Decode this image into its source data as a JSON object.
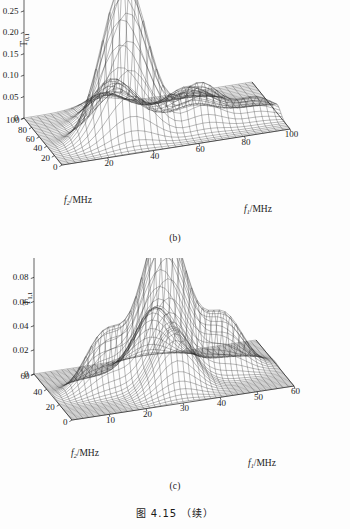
{
  "figure": {
    "caption": "图 4.15 （续）",
    "panels": [
      {
        "id": "b",
        "sublabel": "(b)"
      },
      {
        "id": "c",
        "sublabel": "(c)"
      }
    ]
  },
  "chart_data": [
    {
      "type": "surface",
      "panel": "(b)",
      "title": "",
      "zlabel_base": "T",
      "zlabel_sub": "0,1",
      "xlabel_base": "f",
      "xlabel_sub": "1",
      "xlabel_unit": "/MHz",
      "ylabel_base": "f",
      "ylabel_sub": "2",
      "ylabel_unit": "/MHz",
      "xticks": [
        0,
        20,
        40,
        60,
        80,
        100
      ],
      "yticks": [
        0,
        20,
        40,
        60,
        80,
        100
      ],
      "zticks": [
        0,
        0.05,
        0.1,
        0.15,
        0.2,
        0.25,
        0.3,
        0.35
      ],
      "ztick_labels": [
        "0",
        "0.05",
        "0.10",
        "0.15",
        "0.20",
        "0.25",
        "0.30",
        "0.35"
      ],
      "xlim": [
        0,
        100
      ],
      "ylim": [
        0,
        100
      ],
      "zlim": [
        0,
        0.35
      ],
      "grid": false,
      "legend": "none",
      "peaks": [
        {
          "x": 33,
          "y": 33,
          "z": 0.37,
          "sx": 10,
          "sy": 10
        },
        {
          "x": 66,
          "y": 33,
          "z": 0.1,
          "sx": 9,
          "sy": 9
        },
        {
          "x": 33,
          "y": 66,
          "z": 0.1,
          "sx": 9,
          "sy": 9
        },
        {
          "x": 66,
          "y": 66,
          "z": 0.055,
          "sx": 9,
          "sy": 9
        },
        {
          "x": 90,
          "y": 33,
          "z": 0.045,
          "sx": 8,
          "sy": 8
        },
        {
          "x": 33,
          "y": 90,
          "z": 0.04,
          "sx": 8,
          "sy": 8
        }
      ]
    },
    {
      "type": "surface",
      "panel": "(c)",
      "title": "",
      "zlabel_base": "T",
      "zlabel_sub": "1,1",
      "xlabel_base": "f",
      "xlabel_sub": "1",
      "xlabel_unit": "/MHz",
      "ylabel_base": "f",
      "ylabel_sub": "2",
      "ylabel_unit": "/MHz",
      "xticks": [
        0,
        10,
        20,
        30,
        40,
        50,
        60
      ],
      "yticks": [
        0,
        20,
        40,
        60
      ],
      "zticks": [
        0,
        0.02,
        0.04,
        0.06,
        0.08,
        0.1,
        0.12
      ],
      "ztick_labels": [
        "0",
        "0.02",
        "0.04",
        "0.06",
        "0.08",
        "0.10",
        "0.12"
      ],
      "xlim": [
        0,
        60
      ],
      "ylim": [
        0,
        60
      ],
      "zlim": [
        0,
        0.12
      ],
      "grid": false,
      "legend": "none",
      "peaks": [
        {
          "x": 30,
          "y": 30,
          "z": 0.132,
          "sx": 6.0,
          "sy": 6.0
        },
        {
          "x": 14,
          "y": 30,
          "z": 0.046,
          "sx": 5.2,
          "sy": 5.2
        },
        {
          "x": 46,
          "y": 30,
          "z": 0.046,
          "sx": 5.2,
          "sy": 5.2
        },
        {
          "x": 30,
          "y": 14,
          "z": 0.046,
          "sx": 5.2,
          "sy": 5.2
        },
        {
          "x": 30,
          "y": 46,
          "z": 0.046,
          "sx": 5.2,
          "sy": 5.2
        }
      ]
    }
  ]
}
